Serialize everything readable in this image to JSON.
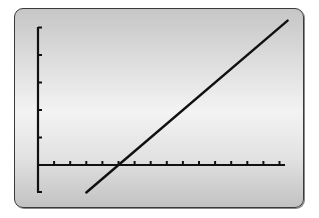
{
  "chart_data": {
    "type": "line",
    "title": "",
    "xlabel": "",
    "ylabel": "",
    "grid": false,
    "legend": null,
    "x_tick_spacing": 1,
    "y_tick_spacing": 1,
    "xlim": [
      0,
      15.5
    ],
    "ylim": [
      -1,
      5.2
    ],
    "x_ticks": [
      1,
      2,
      3,
      4,
      5,
      6,
      7,
      8,
      9,
      10,
      11,
      12,
      13,
      14,
      15
    ],
    "y_ticks": [
      1,
      2,
      3,
      4,
      5
    ],
    "series": [
      {
        "name": "line",
        "equation": "y = 0.5x - 2.5",
        "slope": 0.5,
        "intercept": -2.5,
        "x": [
          3,
          5,
          15.5
        ],
        "y": [
          -1,
          0,
          5.25
        ]
      }
    ],
    "x_intercept": 5,
    "colors": {
      "line": "#111111",
      "axes": "#111111",
      "frame": "#3a3a3a"
    }
  },
  "layout": {
    "origin_px": [
      38,
      165
    ],
    "x_unit_px": 16.1,
    "y_unit_px": 27.5,
    "x_axis_end_px": 285,
    "y_axis_top_px": 27,
    "y_axis_bottom_px": 192
  }
}
